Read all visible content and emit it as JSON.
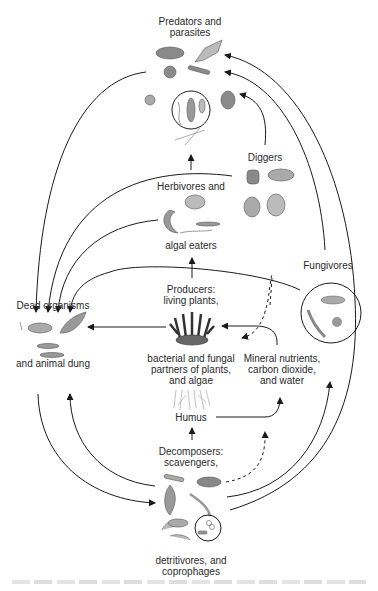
{
  "diagram": {
    "type": "soil food web",
    "nodes": {
      "predators": {
        "line1": "Predators and",
        "line2": "parasites"
      },
      "diggers": {
        "label": "Diggers"
      },
      "herbivores": {
        "line1": "Herbivores and",
        "line2": "algal eaters"
      },
      "producers": {
        "line1": "Producers:",
        "line2": "living plants,",
        "line3": "bacterial and fungal",
        "line4": "partners of plants,",
        "line5": "and algae"
      },
      "fungivores": {
        "label": "Fungivores"
      },
      "dead": {
        "line1": "Dead organisms",
        "line2": "and animal dung"
      },
      "minerals": {
        "line1": "Mineral nutrients,",
        "line2": "carbon dioxide,",
        "line3": "and water"
      },
      "humus": {
        "label": "Humus"
      },
      "decomposers": {
        "line1": "Decomposers:",
        "line2": "scavengers,",
        "line3": "detritivores, and",
        "line4": "coprophages"
      }
    },
    "edges": [
      {
        "from": "herbivores",
        "to": "predators",
        "style": "solid"
      },
      {
        "from": "diggers",
        "to": "predators",
        "style": "solid"
      },
      {
        "from": "fungivores",
        "to": "predators",
        "style": "solid"
      },
      {
        "from": "decomposers",
        "to": "predators",
        "style": "solid"
      },
      {
        "from": "predators",
        "to": "dead",
        "style": "solid"
      },
      {
        "from": "herbivores",
        "to": "dead",
        "style": "solid"
      },
      {
        "from": "fungivores",
        "to": "dead",
        "style": "solid"
      },
      {
        "from": "producers",
        "to": "dead",
        "style": "solid"
      },
      {
        "from": "producers",
        "to": "herbivores",
        "style": "solid"
      },
      {
        "from": "diggers",
        "to": "producers",
        "style": "dashed"
      },
      {
        "from": "minerals",
        "to": "producers",
        "style": "solid"
      },
      {
        "from": "humus",
        "to": "minerals",
        "style": "solid"
      },
      {
        "from": "decomposers",
        "to": "humus",
        "style": "solid"
      },
      {
        "from": "decomposers",
        "to": "minerals",
        "style": "dashed"
      },
      {
        "from": "decomposers",
        "to": "dead",
        "style": "solid"
      },
      {
        "from": "dead",
        "to": "decomposers",
        "style": "solid"
      },
      {
        "from": "decomposers",
        "to": "fungivores",
        "style": "solid"
      }
    ],
    "colors": {
      "line": "#1a1a1a",
      "text": "#2a2a2a",
      "illustration": "#8a8a8a"
    }
  }
}
